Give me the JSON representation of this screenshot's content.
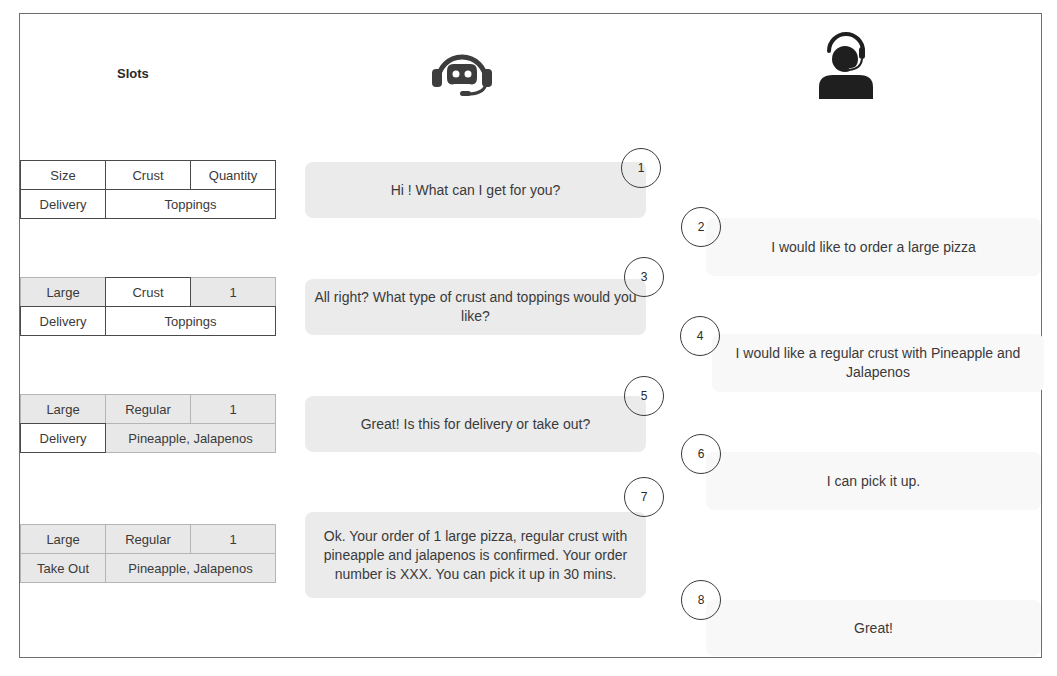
{
  "slots": {
    "title": "Slots",
    "tables": [
      {
        "size": "Size",
        "crust": "Crust",
        "quantity": "Quantity",
        "delivery": "Delivery",
        "toppings": "Toppings",
        "filled": {
          "size": false,
          "crust": false,
          "quantity": false,
          "delivery": false,
          "toppings": false
        }
      },
      {
        "size": "Large",
        "crust": "Crust",
        "quantity": "1",
        "delivery": "Delivery",
        "toppings": "Toppings",
        "filled": {
          "size": true,
          "crust": false,
          "quantity": true,
          "delivery": false,
          "toppings": false
        }
      },
      {
        "size": "Large",
        "crust": "Regular",
        "quantity": "1",
        "delivery": "Delivery",
        "toppings": "Pineapple, Jalapenos",
        "filled": {
          "size": true,
          "crust": true,
          "quantity": true,
          "delivery": false,
          "toppings": true
        }
      },
      {
        "size": "Large",
        "crust": "Regular",
        "quantity": "1",
        "delivery": "Take Out",
        "toppings": "Pineapple, Jalapenos",
        "filled": {
          "size": true,
          "crust": true,
          "quantity": true,
          "delivery": true,
          "toppings": true
        }
      }
    ]
  },
  "icons": {
    "bot": "chatbot-headset-icon",
    "user": "customer-headset-icon"
  },
  "conversation": {
    "bot": [
      {
        "step": "1",
        "text": "Hi ! What can I get for you?"
      },
      {
        "step": "3",
        "text": "All right? What type of crust and toppings would you like?"
      },
      {
        "step": "5",
        "text": "Great! Is this for delivery or take out?"
      },
      {
        "step": "7",
        "text": "Ok. Your order of 1 large pizza, regular crust with pineapple and jalapenos is confirmed. Your order number is XXX. You can pick it up in 30 mins."
      }
    ],
    "user": [
      {
        "step": "2",
        "text": "I would like to order a large pizza"
      },
      {
        "step": "4",
        "text": "I would like a regular crust with Pineapple and Jalapenos"
      },
      {
        "step": "6",
        "text": "I can pick it up."
      },
      {
        "step": "8",
        "text": "Great!"
      }
    ]
  },
  "colors": {
    "frame": "#6e6e6e",
    "bot_bubble": "#ebebeb",
    "user_bubble": "#f8f8f8",
    "filled_slot": "#e8e8e8",
    "icon": "#333333"
  }
}
